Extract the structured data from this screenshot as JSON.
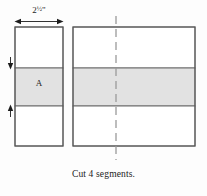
{
  "figure": {
    "title_caption": "Cut 4 segments.",
    "dimension": {
      "value": "2",
      "fraction": "½",
      "unit": "\"",
      "full_text": "2½\"",
      "orientation": "horizontal",
      "applies_to": "strip-width"
    },
    "segment_label": "A",
    "colors": {
      "outline": "#6d6d6d",
      "band_fill": "#e2e2e2",
      "unshaded_fill": "#ffffff",
      "dashed_line": "#9a9a9a",
      "arrow": "#1c1c1c",
      "text": "#1c1c1c",
      "background": "#fdfdfd"
    },
    "left_strip": {
      "name": "pieced-strip-segment",
      "x": 15,
      "y": 27,
      "width": 48,
      "height": 119,
      "bands": [
        {
          "label": "",
          "shaded": false,
          "y": 27,
          "height": 41
        },
        {
          "label": "A",
          "shaded": true,
          "y": 68,
          "height": 38
        },
        {
          "label": "",
          "shaded": false,
          "y": 106,
          "height": 40
        }
      ]
    },
    "right_unit": {
      "name": "pieced-strip-set",
      "x": 73,
      "y": 27,
      "width": 122,
      "height": 119,
      "bands": [
        {
          "label": "",
          "shaded": false,
          "y": 27,
          "height": 41
        },
        {
          "label": "",
          "shaded": true,
          "y": 68,
          "height": 38
        },
        {
          "label": "",
          "shaded": false,
          "y": 106,
          "height": 40
        }
      ],
      "cut_line": {
        "name": "center-cut-line",
        "style": "dashed",
        "orientation": "vertical",
        "x": 116,
        "y_top": 16,
        "y_bottom": 160
      }
    },
    "markers": [
      {
        "name": "band-top-arrow",
        "x": 10,
        "y": 68,
        "direction": "down"
      },
      {
        "name": "band-bottom-arrow",
        "x": 10,
        "y": 106,
        "direction": "up"
      }
    ]
  }
}
